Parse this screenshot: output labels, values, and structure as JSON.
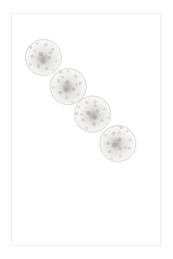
{
  "image": {
    "kind": "scanned-photograph",
    "background_color": "#ffffff",
    "width": 173,
    "height": 259,
    "description": "Four overlapping mottled grey spherical blobs arranged in a diagonal chain from upper-left to lower-right on a faint white scanned page",
    "alt_text": "Four pale grey speckled spheres in a diagonal chain"
  },
  "frame": {
    "name": "paper-frame",
    "border_color": "#f1f1f1",
    "x": 11,
    "y": 13,
    "width": 150,
    "height": 233
  },
  "specimens": [
    {
      "label": "sphere-1",
      "cx": 42,
      "cy": 56,
      "diameter": 38,
      "tint": "#b9b6b0",
      "opacity": 0.92
    },
    {
      "label": "sphere-2",
      "cx": 67,
      "cy": 85,
      "diameter": 38,
      "tint": "#b5b2ac",
      "opacity": 0.94
    },
    {
      "label": "sphere-3",
      "cx": 91,
      "cy": 113,
      "diameter": 38,
      "tint": "#b2afa9",
      "opacity": 0.94
    },
    {
      "label": "sphere-4",
      "cx": 117,
      "cy": 142,
      "diameter": 38,
      "tint": "#b0ada7",
      "opacity": 0.92
    }
  ]
}
